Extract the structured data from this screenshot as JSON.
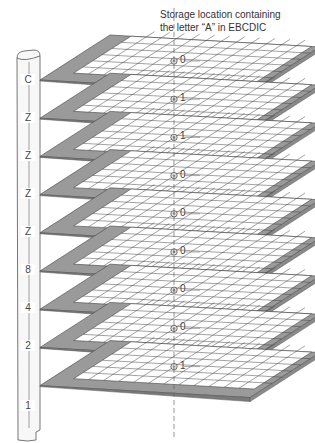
{
  "caption": {
    "line1": "Storage location containing",
    "line2": "the letter “A” in EBCDIC"
  },
  "colors": {
    "plane_frame": "#9a9a9a",
    "plane_edge": "#555555",
    "grid_line": "#444444",
    "plane_fill": "#ffffff",
    "column_fill": "#f7f7f7"
  },
  "planes": [
    {
      "track_label": "C",
      "bit": "0"
    },
    {
      "track_label": "Z",
      "bit": "1"
    },
    {
      "track_label": "Z",
      "bit": "1"
    },
    {
      "track_label": "Z",
      "bit": "0"
    },
    {
      "track_label": "Z",
      "bit": "0"
    },
    {
      "track_label": "8",
      "bit": "0"
    },
    {
      "track_label": "4",
      "bit": "0"
    },
    {
      "track_label": "2",
      "bit": "0"
    },
    {
      "track_label": "1",
      "bit": "1"
    }
  ]
}
